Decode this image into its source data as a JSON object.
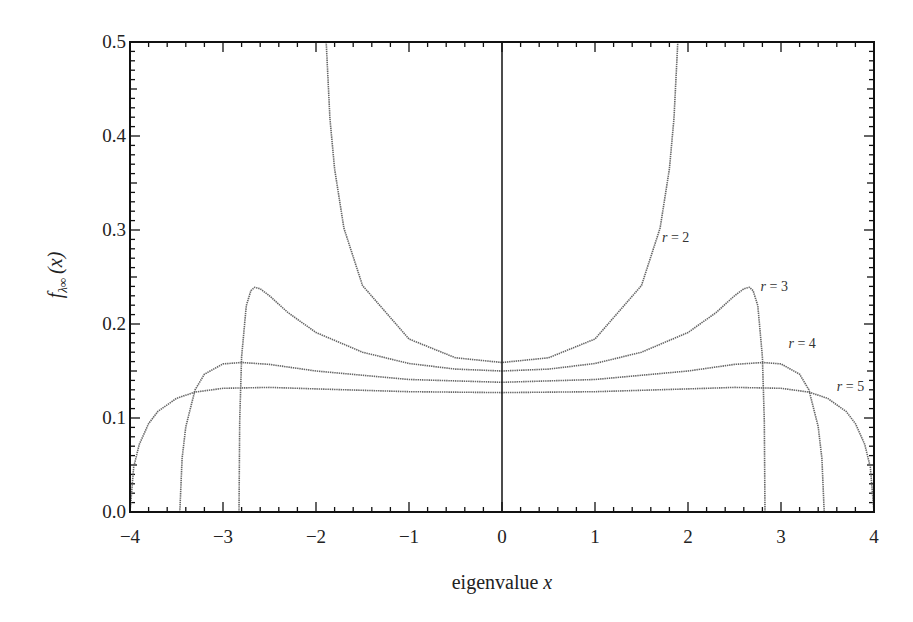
{
  "chart_data": {
    "type": "line",
    "title": "",
    "xlabel": "eigenvalue x",
    "ylabel": "f_{λ∞}(x)",
    "xlim": [
      -4,
      4
    ],
    "ylim": [
      0,
      0.5
    ],
    "grid": false,
    "legend": "inline labels",
    "x_ticks": [
      -4,
      -3,
      -2,
      -1,
      0,
      1,
      2,
      3,
      4
    ],
    "x_tick_labels": [
      "−4",
      "−3",
      "−2",
      "−1",
      "0",
      "1",
      "2",
      "3",
      "4"
    ],
    "y_ticks": [
      0.0,
      0.1,
      0.2,
      0.3,
      0.4,
      0.5
    ],
    "y_tick_labels": [
      "0.0",
      "0.1",
      "0.2",
      "0.3",
      "0.4",
      "0.5"
    ],
    "vertical_line_at_x": 0,
    "series": [
      {
        "name": "r = 2",
        "label_pos": [
          1.72,
          0.287
        ],
        "x": [
          0,
          0.5,
          1.0,
          1.5,
          1.7,
          1.8,
          1.85,
          1.89
        ],
        "y": [
          0.159,
          0.164,
          0.184,
          0.241,
          0.302,
          0.365,
          0.419,
          0.5
        ]
      },
      {
        "name": "r = 3",
        "label_pos": [
          2.78,
          0.235
        ],
        "x": [
          0,
          0.5,
          1.0,
          1.5,
          2.0,
          2.3,
          2.5,
          2.6,
          2.66,
          2.7,
          2.75,
          2.8,
          2.82,
          2.828
        ],
        "y": [
          0.15,
          0.152,
          0.158,
          0.17,
          0.191,
          0.212,
          0.23,
          0.2375,
          0.239,
          0.2354,
          0.2196,
          0.165,
          0.097,
          0.0
        ]
      },
      {
        "name": "r = 4",
        "label_pos": [
          3.08,
          0.174
        ],
        "x": [
          0,
          1.0,
          2.0,
          2.5,
          2.8,
          3.0,
          3.2,
          3.3,
          3.4,
          3.44,
          3.464
        ],
        "y": [
          0.138,
          0.141,
          0.15,
          0.157,
          0.159,
          0.1575,
          0.1466,
          0.13,
          0.0907,
          0.057,
          0.0
        ]
      },
      {
        "name": "r = 5",
        "label_pos": [
          3.6,
          0.129
        ],
        "x": [
          0,
          1.0,
          2.0,
          2.5,
          3.0,
          3.3,
          3.5,
          3.7,
          3.8,
          3.9,
          3.96,
          4.0
        ],
        "y": [
          0.127,
          0.128,
          0.131,
          0.1325,
          0.1316,
          0.1275,
          0.121,
          0.107,
          0.094,
          0.072,
          0.048,
          0.0
        ]
      }
    ]
  },
  "axis": {
    "x_title": "eigenvalue x",
    "y_title_main": "f",
    "y_title_sub": "λ∞",
    "y_title_arg": "(x)"
  },
  "labels": {
    "r2": "r = 2",
    "r3": "r = 3",
    "r4": "r = 4",
    "r5": "r = 5"
  },
  "colors": {
    "axis": "#111111",
    "curve": "#666666"
  }
}
